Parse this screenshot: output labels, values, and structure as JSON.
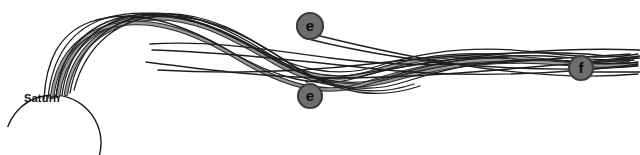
{
  "figure": {
    "type": "diagram",
    "background_color": "#ffffff",
    "width": 640,
    "height": 155
  },
  "planet": {
    "name": "Saturn",
    "label": "Saturn",
    "label_x": 24,
    "label_y": 92,
    "arc": {
      "center_x": 53,
      "center_y": 143,
      "radius": 48,
      "stroke": "#1a1a1a",
      "stroke_width": 1.4
    }
  },
  "nodes": [
    {
      "id": "node-e-upper",
      "label": "e",
      "cx": 310,
      "cy": 26,
      "r": 13,
      "fill": "#6e6e6e",
      "ring": "#3d3d3d",
      "text_color": "#0d0d0d"
    },
    {
      "id": "node-e-lower",
      "label": "e",
      "cx": 310,
      "cy": 96,
      "r": 12,
      "fill": "#6e6e6e",
      "ring": "#3d3d3d",
      "text_color": "#0d0d0d"
    },
    {
      "id": "node-f",
      "label": "f",
      "cx": 581,
      "cy": 68,
      "r": 12,
      "fill": "#6e6e6e",
      "ring": "#3d3d3d",
      "text_color": "#0d0d0d"
    }
  ],
  "strand_styles": {
    "ribbon_fill": "#9a9a9a",
    "ribbon_edge": "#2a2a2a",
    "thin_line": "#1e1e1e",
    "ribbon_width": 4.4,
    "thin_width": 1.3
  },
  "strands": {
    "ribbons": [
      "M 58,96 C 62,62 82,34 120,22 C 168,8 214,26 252,48 C 292,72 330,86 372,72 C 420,56 470,52 520,58 C 556,62 592,66 628,60",
      "M 66,94 C 72,56 96,28 138,20 C 190,11 236,40 274,62 C 312,84 350,92 392,80 C 440,66 492,60 540,62 C 572,64 604,68 636,64",
      "M 52,97 C 56,66 70,40 104,28 C 150,13 198,34 238,58 C 282,84 322,98 364,84 C 412,68 462,58 512,60"
    ],
    "thin_lines": [
      "M 48,98 C 52,60 68,30 106,18 C 156,4 206,22 248,44 C 292,68 334,80 378,66 C 428,50 484,46 536,52 C 572,56 606,60 638,54",
      "M 56,97 C 60,54 84,24 128,16 C 182,8 230,34 268,56 C 308,80 348,90 392,76 C 442,60 496,54 546,56 C 578,58 610,62 638,58",
      "M 62,95 C 68,50 96,20 142,14 C 198,8 244,38 282,62 C 322,86 362,96 404,82 C 452,66 504,58 552,60 C 582,62 612,66 638,62",
      "M 70,93 C 78,46 110,18 156,14 C 212,10 256,42 294,66 C 334,90 372,98 414,84",
      "M 44,99 C 46,62 58,34 90,22 C 136,6 186,26 228,50 C 272,76 314,90 356,78 C 406,64 458,56 508,58",
      "M 74,90 C 86,44 120,16 166,16 C 220,16 262,46 300,70 C 340,94 378,100 420,86",
      "M 150,44 C 210,40 270,50 330,58 C 398,67 468,66 536,60 C 572,57 606,56 630,54",
      "M 146,62 C 208,70 272,78 336,78 C 404,78 476,72 544,66 C 578,63 610,62 634,60",
      "M 152,50 C 222,52 296,60 366,68 C 438,76 512,76 584,70 C 608,68 624,66 638,64",
      "M 158,70 C 228,74 300,72 370,64 C 442,56 514,50 586,54 C 610,56 626,58 640,58",
      "M 304,38 C 360,52 420,62 480,66 C 538,70 592,70 638,66",
      "M 306,82 C 364,74 424,62 482,56 C 540,50 594,48 640,50",
      "M 312,34 C 368,48 424,60 482,68 C 540,76 596,78 638,74",
      "M 588,62 C 606,60 622,58 640,56",
      "M 590,72 C 608,72 624,72 640,72"
    ]
  }
}
